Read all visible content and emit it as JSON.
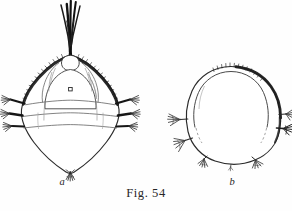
{
  "plate": {
    "caption": "Fig. 54",
    "background_color": "#fefefe",
    "ink_color": "#1a1a1a",
    "shading_color": "#3a3a3a"
  },
  "figures": [
    {
      "label": "a",
      "name": "specimen-a",
      "description": "dorsal view of diamond-shaped carapace with apical setal plume",
      "parts": {
        "plume": "dark-setal-plume",
        "eye_spot": "median-eye-spot",
        "lateral_setae_left": 3,
        "lateral_setae_right": 3,
        "caudal_tuft": "posterior-setal-fan"
      }
    },
    {
      "label": "b",
      "name": "specimen-b",
      "description": "ovate body in side view with marginal setal tufts",
      "parts": {
        "lateral_setae_left": 2,
        "lateral_setae_right": 2,
        "ventral_tufts": 2,
        "dorsal_bristles": "apical-bristle-row"
      }
    }
  ]
}
